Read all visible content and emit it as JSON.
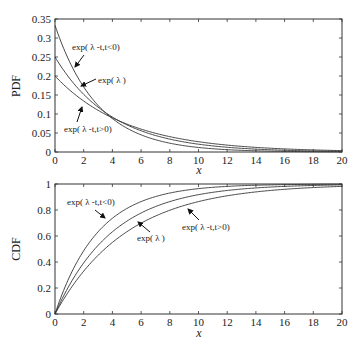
{
  "chart_data": [
    {
      "type": "line",
      "title": "",
      "xlabel": "x",
      "ylabel": "PDF",
      "xlim": [
        0,
        20
      ],
      "ylim": [
        0,
        0.35
      ],
      "xticks": [
        0,
        2,
        4,
        6,
        8,
        10,
        12,
        14,
        16,
        18,
        20
      ],
      "yticks": [
        0,
        0.05,
        0.1,
        0.15,
        0.2,
        0.25,
        0.3,
        0.35
      ],
      "ytick_labels": [
        "0",
        "0.05",
        "0.1",
        "0.15",
        "0.2",
        "0.25",
        "0.3",
        "0.35"
      ],
      "grid": false,
      "legend": "none (inline annotations with arrows)",
      "series": [
        {
          "name": "exp(λ-t,t<0)",
          "rate": 0.3333,
          "x": [
            0,
            2,
            4,
            6,
            8,
            10,
            12,
            14,
            16,
            18,
            20
          ],
          "values": [
            0.333,
            0.171,
            0.088,
            0.045,
            0.023,
            0.012,
            0.006,
            0.003,
            0.002,
            0.001,
            0.0004
          ]
        },
        {
          "name": "exp(λ)",
          "rate": 0.25,
          "x": [
            0,
            2,
            4,
            6,
            8,
            10,
            12,
            14,
            16,
            18,
            20
          ],
          "values": [
            0.25,
            0.152,
            0.092,
            0.056,
            0.034,
            0.021,
            0.012,
            0.008,
            0.005,
            0.003,
            0.002
          ]
        },
        {
          "name": "exp(λ-t,t>0)",
          "rate": 0.2,
          "x": [
            0,
            2,
            4,
            6,
            8,
            10,
            12,
            14,
            16,
            18,
            20
          ],
          "values": [
            0.2,
            0.134,
            0.09,
            0.06,
            0.04,
            0.027,
            0.018,
            0.012,
            0.008,
            0.005,
            0.004
          ]
        }
      ],
      "annotations": [
        {
          "text": "exp(λ-t,t<0)",
          "series": 0
        },
        {
          "text": "exp(λ)",
          "series": 1
        },
        {
          "text": "exp(λ-t,t>0)",
          "series": 2
        }
      ]
    },
    {
      "type": "line",
      "title": "",
      "xlabel": "x",
      "ylabel": "CDF",
      "xlim": [
        0,
        20
      ],
      "ylim": [
        0,
        1
      ],
      "xticks": [
        0,
        2,
        4,
        6,
        8,
        10,
        12,
        14,
        16,
        18,
        20
      ],
      "yticks": [
        0,
        0.2,
        0.4,
        0.6,
        0.8,
        1
      ],
      "ytick_labels": [
        "0",
        "0.2",
        "0.4",
        "0.6",
        "0.8",
        "1"
      ],
      "grid": false,
      "legend": "none (inline annotations with arrows)",
      "series": [
        {
          "name": "exp(λ-t,t<0)",
          "rate": 0.3333,
          "x": [
            0,
            2,
            4,
            6,
            8,
            10,
            12,
            14,
            16,
            18,
            20
          ],
          "values": [
            0,
            0.487,
            0.736,
            0.865,
            0.931,
            0.964,
            0.982,
            0.991,
            0.995,
            0.998,
            0.999
          ]
        },
        {
          "name": "exp(λ)",
          "rate": 0.25,
          "x": [
            0,
            2,
            4,
            6,
            8,
            10,
            12,
            14,
            16,
            18,
            20
          ],
          "values": [
            0,
            0.393,
            0.632,
            0.777,
            0.865,
            0.918,
            0.95,
            0.97,
            0.982,
            0.989,
            0.993
          ]
        },
        {
          "name": "exp(λ-t,t>0)",
          "rate": 0.2,
          "x": [
            0,
            2,
            4,
            6,
            8,
            10,
            12,
            14,
            16,
            18,
            20
          ],
          "values": [
            0,
            0.33,
            0.551,
            0.699,
            0.798,
            0.865,
            0.909,
            0.939,
            0.959,
            0.973,
            0.982
          ]
        }
      ],
      "annotations": [
        {
          "text": "exp(λ-t,t<0)",
          "series": 0
        },
        {
          "text": "exp(λ)",
          "series": 1
        },
        {
          "text": "exp(λ-t,t>0)",
          "series": 2
        }
      ]
    }
  ],
  "pdf_panel": {
    "ylabel": "PDF",
    "xlabel": "x",
    "annotations": {
      "neg": "exp( λ -t,t<0)",
      "base": "exp( λ )",
      "pos": "exp( λ -t,t>0)"
    }
  },
  "cdf_panel": {
    "ylabel": "CDF",
    "xlabel": "x",
    "annotations": {
      "neg": "exp( λ -t,t<0)",
      "base": "exp( λ )",
      "pos": "exp( λ -t,t>0)"
    }
  }
}
